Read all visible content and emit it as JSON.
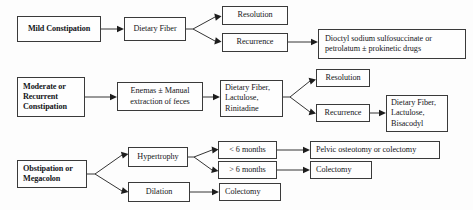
{
  "diagram": {
    "type": "flowchart",
    "background_color": "#fdfdfd",
    "box_border_color": "#3a3a3a",
    "connector_color": "#1d1d1d"
  },
  "nodes": {
    "mild_constipation": {
      "label": "Mild Constipation",
      "bold": true
    },
    "dietary_fiber": {
      "label": "Dietary Fiber",
      "bold": false
    },
    "resolution_1": {
      "label": "Resolution",
      "bold": false
    },
    "recurrence_1": {
      "label": "Recurrence",
      "bold": false
    },
    "dioctyl": {
      "label": "Dioctyl sodium sulfosuccinate or\npetrolatum ± prokinetic drugs",
      "bold": false
    },
    "moderate_recurrent": {
      "label": "Moderate or\nRecurrent\nConstipation",
      "bold": true
    },
    "enemas": {
      "label": "Enemas ± Manual\nextraction of feces",
      "bold": false
    },
    "fiber_lactulose_rinitadine": {
      "label": "Dietary Fiber,\nLactulose,\nRinitadine",
      "bold": false
    },
    "resolution_2": {
      "label": "Resolution",
      "bold": false
    },
    "recurrence_2": {
      "label": "Recurrence",
      "bold": false
    },
    "fiber_lactulose_bisacodyl": {
      "label": "Dietary Fiber,\nLactulose,\nBisacodyl",
      "bold": false
    },
    "obstipation_megacolon": {
      "label": "Obstipation or\nMegacolon",
      "bold": true
    },
    "hypertrophy": {
      "label": "Hypertrophy",
      "bold": false
    },
    "dilation": {
      "label": "Dilation",
      "bold": false
    },
    "less_6_months": {
      "label": "< 6 months",
      "bold": false
    },
    "more_6_months": {
      "label": "> 6 months",
      "bold": false
    },
    "pelvic_osteotomy": {
      "label": "Pelvic osteotomy or colectomy",
      "bold": false
    },
    "colectomy_1": {
      "label": "Colectomy",
      "bold": false
    },
    "colectomy_2": {
      "label": "Colectomy",
      "bold": false
    }
  },
  "edges": [
    {
      "from": "mild_constipation",
      "to": "dietary_fiber"
    },
    {
      "from": "dietary_fiber",
      "to": "resolution_1"
    },
    {
      "from": "dietary_fiber",
      "to": "recurrence_1"
    },
    {
      "from": "recurrence_1",
      "to": "dioctyl"
    },
    {
      "from": "moderate_recurrent",
      "to": "enemas"
    },
    {
      "from": "enemas",
      "to": "fiber_lactulose_rinitadine"
    },
    {
      "from": "fiber_lactulose_rinitadine",
      "to": "resolution_2"
    },
    {
      "from": "fiber_lactulose_rinitadine",
      "to": "recurrence_2"
    },
    {
      "from": "recurrence_2",
      "to": "fiber_lactulose_bisacodyl"
    },
    {
      "from": "obstipation_megacolon",
      "to": "hypertrophy"
    },
    {
      "from": "obstipation_megacolon",
      "to": "dilation"
    },
    {
      "from": "hypertrophy",
      "to": "less_6_months"
    },
    {
      "from": "hypertrophy",
      "to": "more_6_months"
    },
    {
      "from": "less_6_months",
      "to": "pelvic_osteotomy"
    },
    {
      "from": "more_6_months",
      "to": "colectomy_1"
    },
    {
      "from": "dilation",
      "to": "colectomy_2"
    }
  ]
}
